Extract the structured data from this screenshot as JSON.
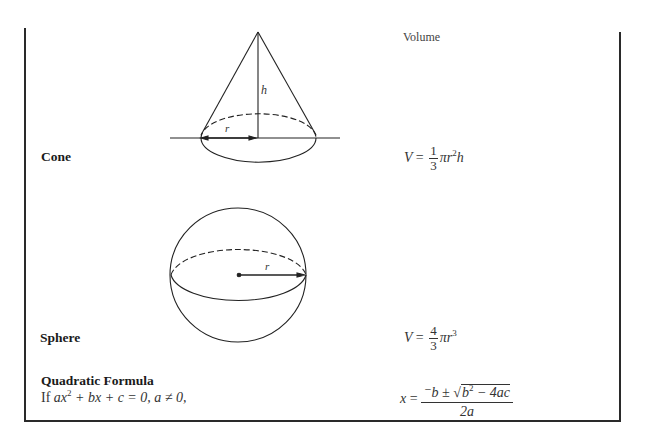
{
  "table": {
    "header": {
      "volume": "Volume"
    },
    "rows": [
      {
        "label": "Cone",
        "figure": {
          "type": "cone",
          "labels": {
            "height": "h",
            "radius": "r"
          }
        },
        "formula": {
          "lhs": "V",
          "eq": "=",
          "num": "1",
          "den": "3",
          "rest": "πr",
          "exp": "2",
          "tail": "h"
        }
      },
      {
        "label": "Sphere",
        "figure": {
          "type": "sphere",
          "labels": {
            "radius": "r"
          }
        },
        "formula": {
          "lhs": "V",
          "eq": "=",
          "num": "4",
          "den": "3",
          "rest": "πr",
          "exp": "3"
        }
      }
    ]
  },
  "quadratic": {
    "title": "Quadratic Formula",
    "condition_prefix": "If ",
    "condition_a": "ax",
    "condition_exp": "2",
    "condition_rest": " + bx + c = 0, a ≠ 0,",
    "formula": {
      "lhs": "x",
      "eq": "=",
      "num_prefix": "⁻b ± √",
      "radicand": "b",
      "radicand_exp": "2",
      "radicand_rest": " − 4ac",
      "den": "2a"
    }
  }
}
